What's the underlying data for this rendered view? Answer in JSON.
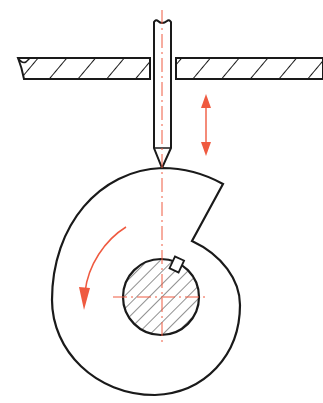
{
  "diagram": {
    "caption_cropped": "",
    "colors": {
      "outline": "#1a1a1a",
      "accent": "#ef5a40",
      "hatch": "#333333",
      "background": "#ffffff"
    },
    "components": [
      {
        "id": "guide-plate",
        "label": "Guide plate (sectioned, hatched) with slot for pusher"
      },
      {
        "id": "pusher",
        "label": "Knife-edge pusher / follower"
      },
      {
        "id": "cam",
        "label": "Spiral snail cam with drop step"
      },
      {
        "id": "shaft",
        "label": "Shaft (sectioned) with key"
      },
      {
        "id": "reciprocation-arrow",
        "label": "Vertical double-headed arrow (pusher reciprocation)"
      },
      {
        "id": "rotation-arrow",
        "label": "Curved arrow (counter-clockwise cam rotation)"
      },
      {
        "id": "center-lines",
        "label": "Dash-dot center lines"
      }
    ]
  }
}
